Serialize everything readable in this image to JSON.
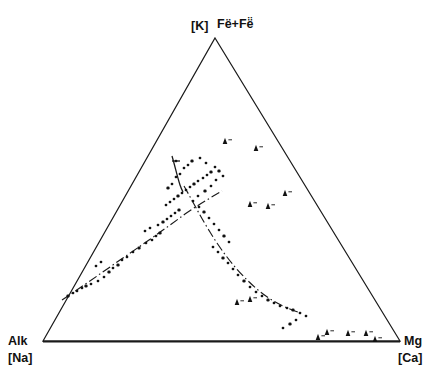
{
  "figure": {
    "type": "ternary-scatter-diagram",
    "background_color": "#ffffff",
    "line_color": "#1a1a1a",
    "marker_color": "#111111"
  },
  "labels": {
    "apex_primary": "[K]",
    "apex_secondary": "Fë+Fë̈",
    "left_primary": "Alk",
    "left_secondary": "[Na]",
    "right_primary": "Mg",
    "right_secondary": "[Ca]"
  },
  "chart_data": {
    "type": "scatter",
    "title": "",
    "xlabel": "",
    "ylabel": "",
    "axes": {
      "apex_top": "[K] Fe·+Fe··",
      "vertex_left": "Alk [Na]",
      "vertex_right": "Mg [Ca]",
      "grid": false,
      "legend_position": "none"
    },
    "triangle_vertices_px": {
      "apex": [
        215,
        38
      ],
      "left": [
        43,
        341
      ],
      "right": [
        400,
        341
      ]
    },
    "series": [
      {
        "name": "circle-markers-left-branch",
        "marker": "circle",
        "points_px": [
          [
            68,
            296
          ],
          [
            73,
            293
          ],
          [
            77,
            291
          ],
          [
            82,
            288
          ],
          [
            86,
            286
          ],
          [
            91,
            284
          ],
          [
            98,
            281
          ],
          [
            104,
            277
          ],
          [
            109,
            272
          ],
          [
            96,
            266
          ],
          [
            101,
            262
          ],
          [
            113,
            268
          ],
          [
            118,
            265
          ],
          [
            122,
            260
          ],
          [
            127,
            257
          ],
          [
            133,
            252
          ],
          [
            139,
            248
          ],
          [
            146,
            243
          ],
          [
            152,
            240
          ],
          [
            156,
            236
          ],
          [
            160,
            233
          ],
          [
            145,
            231
          ],
          [
            150,
            228
          ],
          [
            158,
            225
          ],
          [
            163,
            222
          ],
          [
            167,
            219
          ],
          [
            171,
            216
          ],
          [
            175,
            213
          ],
          [
            179,
            210
          ],
          [
            166,
            205
          ],
          [
            170,
            202
          ],
          [
            174,
            199
          ],
          [
            178,
            196
          ],
          [
            182,
            193
          ],
          [
            186,
            190
          ],
          [
            190,
            187
          ],
          [
            194,
            184
          ],
          [
            198,
            181
          ],
          [
            203,
            178
          ],
          [
            207,
            175
          ],
          [
            211,
            172
          ],
          [
            176,
            177
          ],
          [
            180,
            174
          ],
          [
            172,
            184
          ],
          [
            168,
            188
          ],
          [
            184,
            168
          ],
          [
            188,
            165
          ],
          [
            176,
            161
          ],
          [
            192,
            161
          ],
          [
            200,
            158
          ],
          [
            206,
            163
          ],
          [
            215,
            167
          ],
          [
            219,
            171
          ],
          [
            223,
            176
          ],
          [
            216,
            180
          ],
          [
            211,
            186
          ],
          [
            205,
            191
          ],
          [
            198,
            196
          ],
          [
            193,
            201
          ],
          [
            199,
            207
          ],
          [
            204,
            212
          ],
          [
            209,
            218
          ],
          [
            214,
            224
          ],
          [
            219,
            230
          ],
          [
            224,
            236
          ],
          [
            229,
            242
          ],
          [
            213,
            247
          ],
          [
            218,
            252
          ],
          [
            223,
            258
          ],
          [
            228,
            263
          ],
          [
            233,
            269
          ],
          [
            238,
            275
          ],
          [
            244,
            281
          ],
          [
            250,
            287
          ],
          [
            256,
            292
          ],
          [
            262,
            296
          ],
          [
            268,
            300
          ],
          [
            274,
            303
          ],
          [
            280,
            306
          ],
          [
            287,
            308
          ],
          [
            293,
            310
          ],
          [
            300,
            313
          ],
          [
            306,
            316
          ],
          [
            296,
            320
          ],
          [
            290,
            324
          ],
          [
            283,
            328
          ]
        ]
      },
      {
        "name": "filled-triangle-markers",
        "marker": "triangle",
        "points_px": [
          [
            225,
            142
          ],
          [
            256,
            149
          ],
          [
            285,
            194
          ],
          [
            250,
            205
          ],
          [
            268,
            207
          ],
          [
            237,
            303
          ],
          [
            250,
            300
          ],
          [
            318,
            338
          ],
          [
            327,
            333
          ],
          [
            348,
            334
          ],
          [
            366,
            334
          ],
          [
            375,
            340
          ]
        ]
      }
    ],
    "trend_curves": [
      {
        "name": "main-arc-curve",
        "style": "dash-dot",
        "path_px": [
          [
            62,
            300
          ],
          [
            78,
            288
          ],
          [
            96,
            275
          ],
          [
            115,
            262
          ],
          [
            135,
            248
          ],
          [
            155,
            234
          ],
          [
            172,
            222
          ],
          [
            188,
            212
          ],
          [
            200,
            205
          ],
          [
            210,
            199
          ],
          [
            217,
            194
          ],
          [
            222,
            191
          ]
        ]
      },
      {
        "name": "descending-branch-curve",
        "style": "dash-dot",
        "path_px": [
          [
            184,
            186
          ],
          [
            191,
            197
          ],
          [
            198,
            209
          ],
          [
            205,
            222
          ],
          [
            212,
            235
          ],
          [
            220,
            248
          ],
          [
            229,
            261
          ],
          [
            240,
            274
          ],
          [
            252,
            286
          ],
          [
            265,
            295
          ],
          [
            278,
            303
          ],
          [
            290,
            309
          ],
          [
            300,
            313
          ]
        ]
      },
      {
        "name": "short-vertical-curve",
        "style": "solid",
        "path_px": [
          [
            173,
            157
          ],
          [
            175,
            166
          ],
          [
            177,
            175
          ],
          [
            179,
            183
          ],
          [
            182,
            190
          ]
        ]
      }
    ]
  }
}
